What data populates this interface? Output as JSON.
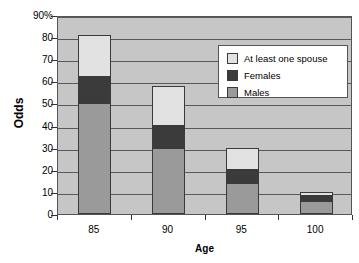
{
  "chart_data": {
    "type": "bar",
    "subtype": "stacked-bar",
    "title": "",
    "xlabel": "Age",
    "ylabel": "Odds",
    "categories": [
      "85",
      "90",
      "95",
      "100"
    ],
    "ylim": [
      0,
      90
    ],
    "ytick_labels": [
      "90%",
      "80",
      "70",
      "60",
      "50",
      "40",
      "30",
      "20",
      "10",
      "0"
    ],
    "ytick_values": [
      90,
      80,
      70,
      60,
      50,
      40,
      30,
      20,
      10,
      0
    ],
    "grid": true,
    "legend_position": "upper right",
    "series": [
      {
        "name": "Males",
        "values": [
          50,
          30,
          14,
          6
        ],
        "color": "#9a9a9a"
      },
      {
        "name": "Females",
        "values": [
          12,
          10,
          6,
          2
        ],
        "color": "#3b3b3b"
      },
      {
        "name": "At least one spouse",
        "values": [
          19,
          18,
          10,
          2
        ],
        "color": "#e2e2e2"
      }
    ],
    "cumulative_tops": [
      81,
      58,
      30,
      10
    ]
  },
  "legend": {
    "items": [
      {
        "label": "At least one spouse",
        "swatch": "#e2e2e2"
      },
      {
        "label": "Females",
        "swatch": "#3b3b3b"
      },
      {
        "label": "Males",
        "swatch": "#9a9a9a"
      }
    ]
  },
  "axes": {
    "y_title": "Odds",
    "x_title": "Age"
  }
}
